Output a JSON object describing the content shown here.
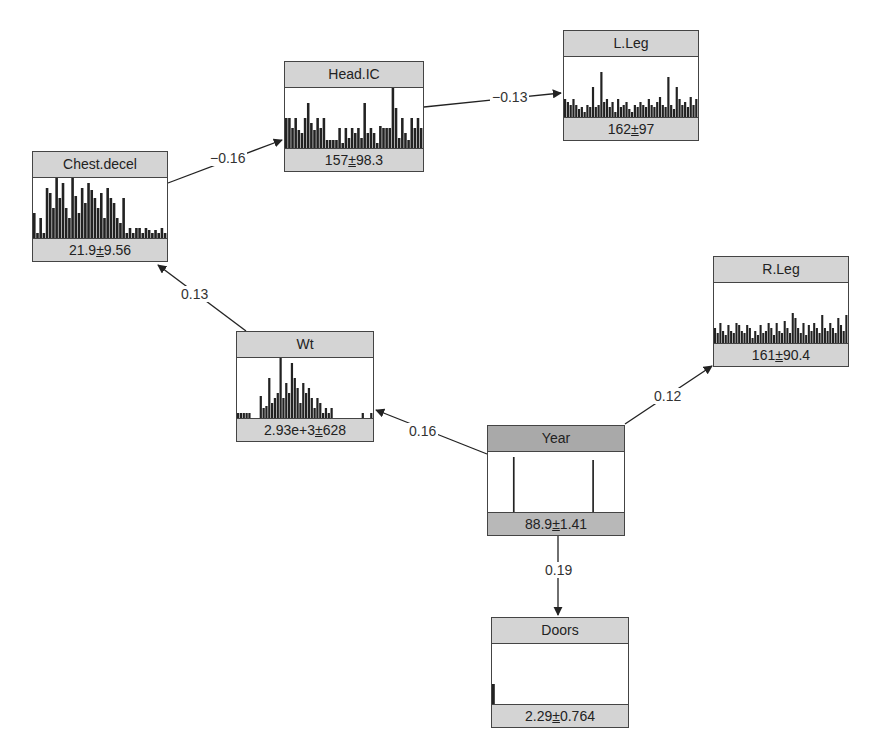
{
  "diagram": {
    "type": "bayesian-network",
    "nodes": [
      {
        "id": "head_ic",
        "label": "Head.IC",
        "mean": "157",
        "sd": "98.3",
        "x": 284,
        "y": 61,
        "w": 140,
        "selected": false
      },
      {
        "id": "l_leg",
        "label": "L.Leg",
        "mean": "162",
        "sd": "97",
        "x": 563,
        "y": 30,
        "w": 136,
        "selected": false
      },
      {
        "id": "chest_decel",
        "label": "Chest.decel",
        "mean": "21.9",
        "sd": "9.56",
        "x": 32,
        "y": 151,
        "w": 136,
        "selected": false
      },
      {
        "id": "wt",
        "label": "Wt",
        "mean": "2.93e+3",
        "sd": "628",
        "x": 236,
        "y": 331,
        "w": 138,
        "selected": false
      },
      {
        "id": "r_leg",
        "label": "R.Leg",
        "mean": "161",
        "sd": "90.4",
        "x": 713,
        "y": 256,
        "w": 136,
        "selected": false
      },
      {
        "id": "year",
        "label": "Year",
        "mean": "88.9",
        "sd": "1.41",
        "x": 487,
        "y": 425,
        "w": 138,
        "selected": true
      },
      {
        "id": "doors",
        "label": "Doors",
        "mean": "2.29",
        "sd": "0.764",
        "x": 491,
        "y": 617,
        "w": 138,
        "selected": false
      }
    ],
    "edges": [
      {
        "from": "chest_decel",
        "to": "head_ic",
        "weight": "−0.16"
      },
      {
        "from": "head_ic",
        "to": "l_leg",
        "weight": "−0.13"
      },
      {
        "from": "wt",
        "to": "chest_decel",
        "weight": "0.13"
      },
      {
        "from": "year",
        "to": "wt",
        "weight": "0.16"
      },
      {
        "from": "year",
        "to": "r_leg",
        "weight": "0.12"
      },
      {
        "from": "year",
        "to": "doors",
        "weight": "0.19"
      }
    ],
    "pm_symbol": "±",
    "colors": {
      "header": "#d4d4d4",
      "header_selected": "#a9a9a9",
      "border": "#444444",
      "bar": "#222222",
      "edge": "#222222"
    }
  },
  "histograms": {
    "head_ic": [
      30,
      30,
      20,
      30,
      18,
      15,
      30,
      45,
      25,
      18,
      30,
      20,
      30,
      8,
      8,
      8,
      8,
      20,
      5,
      20,
      10,
      20,
      15,
      20,
      10,
      45,
      15,
      20,
      15,
      5,
      22,
      20,
      20,
      20,
      60,
      40,
      10,
      30,
      15,
      8,
      30,
      20,
      30,
      20
    ],
    "l_leg": [
      18,
      15,
      12,
      18,
      12,
      8,
      10,
      5,
      12,
      10,
      30,
      10,
      12,
      45,
      15,
      18,
      10,
      15,
      5,
      18,
      10,
      12,
      15,
      8,
      5,
      12,
      10,
      15,
      12,
      10,
      18,
      12,
      10,
      15,
      20,
      12,
      10,
      40,
      12,
      8,
      30,
      18,
      12,
      15,
      10,
      20,
      12,
      18
    ],
    "chest_decel": [
      25,
      5,
      20,
      5,
      50,
      45,
      30,
      70,
      40,
      55,
      30,
      20,
      60,
      42,
      25,
      50,
      35,
      55,
      48,
      40,
      30,
      45,
      20,
      50,
      40,
      35,
      20,
      15,
      40,
      5,
      10,
      5,
      10,
      10,
      5,
      10,
      8,
      5,
      8,
      5,
      10,
      5
    ],
    "wt": [
      5,
      5,
      5,
      5,
      5,
      0,
      0,
      0,
      22,
      10,
      12,
      40,
      15,
      20,
      25,
      60,
      20,
      35,
      25,
      55,
      40,
      30,
      15,
      35,
      25,
      30,
      20,
      10,
      20,
      15,
      5,
      10,
      5,
      10,
      0,
      0,
      0,
      0,
      0,
      0,
      0,
      0,
      0,
      0,
      5,
      0,
      0,
      5
    ],
    "r_leg": [
      15,
      10,
      20,
      12,
      8,
      18,
      12,
      10,
      20,
      18,
      12,
      10,
      18,
      15,
      5,
      12,
      8,
      18,
      10,
      12,
      20,
      15,
      8,
      20,
      12,
      10,
      22,
      15,
      10,
      30,
      25,
      15,
      10,
      20,
      8,
      18,
      12,
      20,
      15,
      10,
      28,
      15,
      12,
      20,
      15,
      10,
      25,
      18,
      12,
      28
    ],
    "year": [
      0,
      0,
      0,
      0,
      0,
      0,
      0,
      0,
      0,
      0,
      0,
      55,
      0,
      0,
      0,
      0,
      0,
      0,
      0,
      0,
      0,
      0,
      0,
      0,
      0,
      0,
      0,
      0,
      0,
      0,
      0,
      0,
      0,
      0,
      0,
      0,
      0,
      0,
      0,
      0,
      0,
      0,
      0,
      0,
      0,
      0,
      52,
      0,
      0,
      0,
      0,
      0,
      0,
      0,
      0,
      0,
      0,
      0,
      0,
      0
    ],
    "doors": [
      20,
      0,
      0,
      0,
      0,
      0,
      0,
      0,
      0,
      0,
      0,
      0,
      0,
      0,
      0,
      0,
      0,
      0,
      0,
      0,
      0,
      0,
      0,
      0,
      0,
      0,
      0,
      0,
      0,
      0,
      0,
      0,
      0,
      0,
      0,
      0,
      0,
      0,
      0,
      0
    ]
  }
}
